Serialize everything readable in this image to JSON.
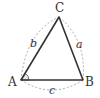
{
  "diagram": {
    "type": "triangle",
    "vertices": {
      "A": {
        "label": "A",
        "x": 21,
        "y": 80
      },
      "B": {
        "label": "B",
        "x": 83,
        "y": 80
      },
      "C": {
        "label": "C",
        "x": 59,
        "y": 17
      }
    },
    "sides": {
      "a": {
        "label": "a",
        "from": "B",
        "to": "C"
      },
      "b": {
        "label": "b",
        "from": "C",
        "to": "A"
      },
      "c": {
        "label": "c",
        "from": "A",
        "to": "B"
      }
    },
    "angle_mark": "A",
    "colors": {
      "edge": "#333333",
      "dashed": "#aaaaaa",
      "angle_fill": "#e6e6e6"
    }
  }
}
